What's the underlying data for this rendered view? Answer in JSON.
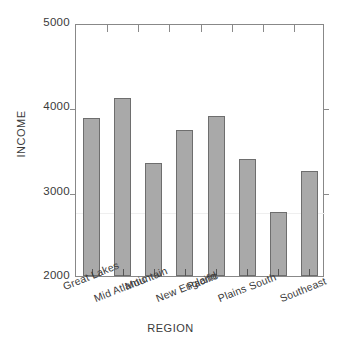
{
  "chart_data": {
    "type": "bar",
    "title": "",
    "xlabel": "REGION",
    "ylabel": "INCOME",
    "categories": [
      "Great Lakes",
      "Mid Atlantic",
      "Mountain",
      "New England",
      "Pacific",
      "Plains",
      "South",
      "Southeast"
    ],
    "values": [
      3870,
      4110,
      3340,
      3730,
      3900,
      3390,
      2760,
      3250
    ],
    "ylim": [
      2000,
      5000
    ],
    "yticks": [
      2000,
      3000,
      4000,
      5000
    ],
    "ytick_labels": [
      "2000",
      "3000",
      "4000",
      "5000"
    ],
    "grid": false,
    "legend": false,
    "bar_fill_color": "#a9a9a9",
    "bar_border_color": "#6e6e6e",
    "axis_color": "#888888",
    "background_color": "#ffffff"
  }
}
